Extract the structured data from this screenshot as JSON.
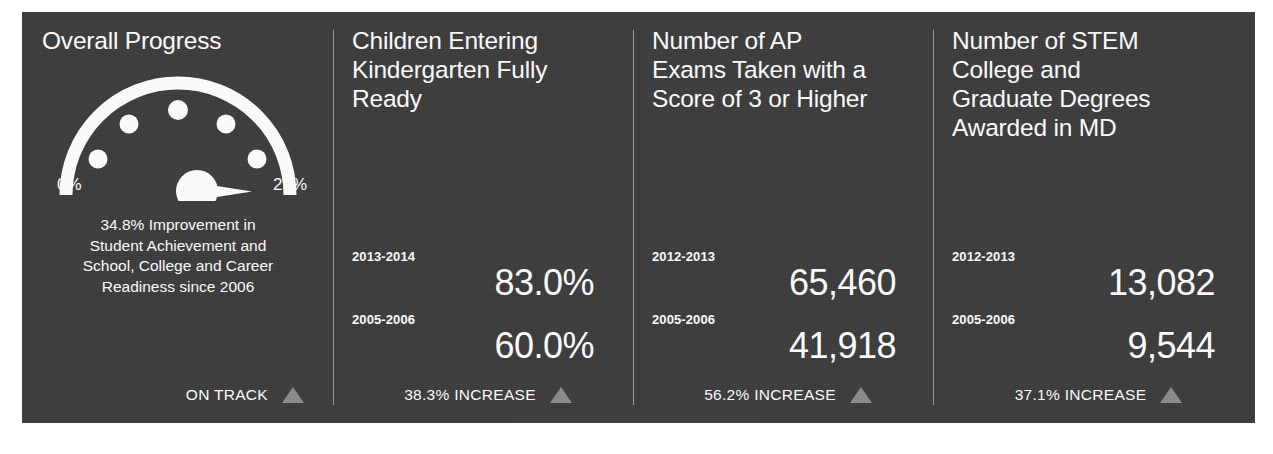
{
  "theme": {
    "panel_bg": "#3b3b3b",
    "text": "#ffffff",
    "divider": "#9a9a9a",
    "arrow": "#8b8b8b",
    "page_bg": "#ffffff"
  },
  "panels": [
    {
      "title": "Overall Progress",
      "gauge": {
        "min_label": "0%",
        "max_label": "25%",
        "tick_count": 5,
        "needle_value": 22.5,
        "min_value": 0,
        "max_value": 25
      },
      "caption": "34.8% Improvement in\nStudent Achievement and\nSchool, College and Career\nReadiness since 2006",
      "footer": {
        "label": "ON TRACK",
        "icon": "triangle-up-icon"
      }
    },
    {
      "title": "Children Entering\nKindergarten Fully\nReady",
      "stats": [
        {
          "year": "2013-2014",
          "value": "83.0%"
        },
        {
          "year": "2005-2006",
          "value": "60.0%"
        }
      ],
      "footer": {
        "label": "38.3% INCREASE",
        "icon": "triangle-up-icon"
      }
    },
    {
      "title": "Number of AP\nExams Taken with a\nScore of 3 or Higher",
      "stats": [
        {
          "year": "2012-2013",
          "value": "65,460"
        },
        {
          "year": "2005-2006",
          "value": "41,918"
        }
      ],
      "footer": {
        "label": "56.2% INCREASE",
        "icon": "triangle-up-icon"
      }
    },
    {
      "title": "Number of STEM\nCollege and\nGraduate Degrees\nAwarded in MD",
      "stats": [
        {
          "year": "2012-2013",
          "value": "13,082"
        },
        {
          "year": "2005-2006",
          "value": "9,544"
        }
      ],
      "footer": {
        "label": "37.1% INCREASE",
        "icon": "triangle-up-icon"
      }
    }
  ]
}
